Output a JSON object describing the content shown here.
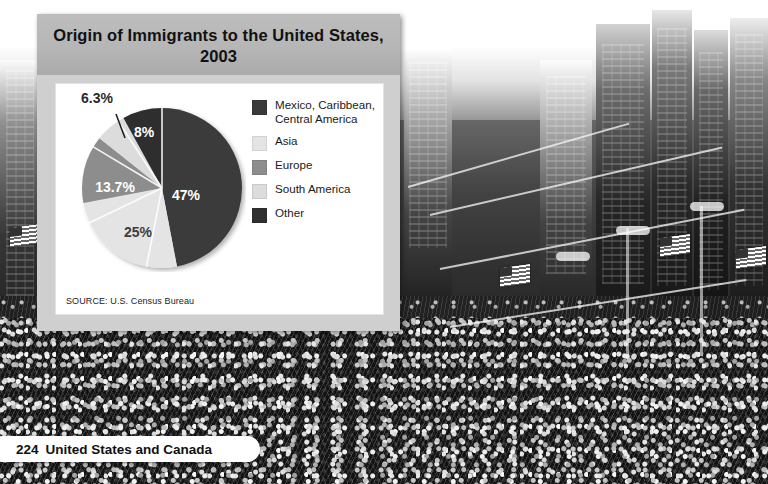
{
  "page": {
    "footer_number": "224",
    "footer_text": "United States and Canada"
  },
  "panel": {
    "title": "Origin of Immigrants to the United States, 2003",
    "source": "SOURCE: U.S. Census Bureau"
  },
  "legend": {
    "items": [
      {
        "label": "Mexico, Caribbean, Central America",
        "color": "#3a3a3a"
      },
      {
        "label": "Asia",
        "color": "#e4e4e4"
      },
      {
        "label": "Europe",
        "color": "#8d8d8d"
      },
      {
        "label": "South America",
        "color": "#dcdcdc"
      },
      {
        "label": "Other",
        "color": "#2f2f2f"
      }
    ]
  },
  "chart_data": {
    "type": "pie",
    "title": "Origin of Immigrants to the United States, 2003",
    "source": "SOURCE: U.S. Census Bureau",
    "legend_position": "right",
    "categories": [
      "Mexico, Caribbean, Central America",
      "Asia",
      "Europe",
      "South America",
      "Other"
    ],
    "values": [
      47,
      25,
      13.7,
      6.3,
      8
    ],
    "labels": [
      "47%",
      "25%",
      "13.7%",
      "6.3%",
      "8%"
    ],
    "colors": [
      "#3a3a3a",
      "#e4e4e4",
      "#8d8d8d",
      "#dcdcdc",
      "#2f2f2f"
    ],
    "label_placement": [
      "inside",
      "inside",
      "inside",
      "outside-callout",
      "inside"
    ],
    "units": "percent",
    "total": 100
  },
  "background": {
    "description": "black-and-white photograph of a crowded city street"
  }
}
